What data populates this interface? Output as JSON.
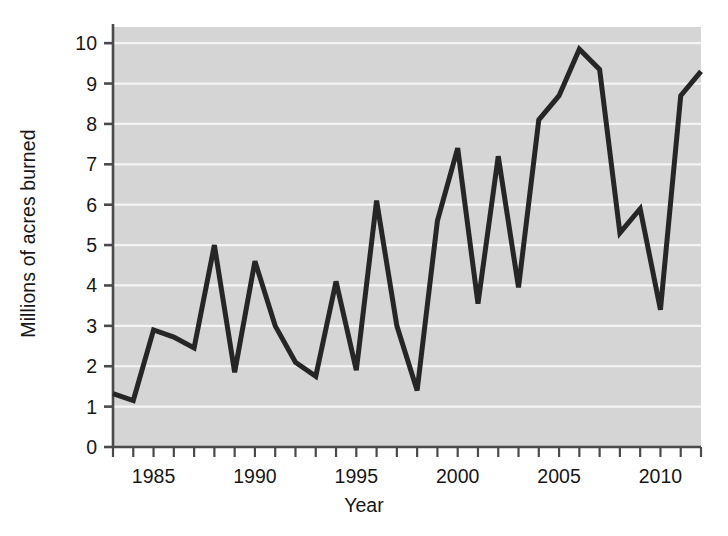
{
  "chart_data": {
    "type": "line",
    "title": "",
    "xlabel": "Year",
    "ylabel": "Millions of acres burned",
    "xlim": [
      1983,
      2012
    ],
    "ylim": [
      0,
      10.4
    ],
    "grid": true,
    "legend": "none",
    "y_ticks": [
      0,
      1,
      2,
      3,
      4,
      5,
      6,
      7,
      8,
      9,
      10
    ],
    "y_tick_labels": [
      "0",
      "1",
      "2",
      "3",
      "4",
      "5",
      "6",
      "7",
      "8",
      "9",
      "10"
    ],
    "x_ticks": [
      1983,
      1984,
      1985,
      1986,
      1987,
      1988,
      1989,
      1990,
      1991,
      1992,
      1993,
      1994,
      1995,
      1996,
      1997,
      1998,
      1999,
      2000,
      2001,
      2002,
      2003,
      2004,
      2005,
      2006,
      2007,
      2008,
      2009,
      2010,
      2011,
      2012
    ],
    "x_tick_labels": [
      "1985",
      "1990",
      "1995",
      "2000",
      "2005",
      "2010"
    ],
    "x_tick_label_values": [
      1985,
      1990,
      1995,
      2000,
      2005,
      2010
    ],
    "x": [
      1983,
      1984,
      1985,
      1986,
      1987,
      1988,
      1989,
      1990,
      1991,
      1992,
      1993,
      1994,
      1995,
      1996,
      1997,
      1998,
      1999,
      2000,
      2001,
      2002,
      2003,
      2004,
      2005,
      2006,
      2007,
      2008,
      2009,
      2010,
      2011,
      2012
    ],
    "values": [
      1.32,
      1.15,
      2.9,
      2.72,
      2.45,
      5.0,
      1.85,
      4.6,
      3.0,
      2.1,
      1.75,
      4.1,
      1.9,
      6.1,
      3.0,
      1.4,
      5.6,
      7.4,
      3.55,
      7.2,
      3.95,
      8.1,
      8.7,
      9.85,
      9.35,
      5.3,
      5.9,
      3.4,
      8.7,
      9.3
    ],
    "series_name": "Acres burned",
    "line_color": "#262626",
    "line_width": 5,
    "plot_background": "#d5d5d5",
    "gridline_color": "#f4f4f4",
    "axis_color": "#4a4a4a"
  }
}
